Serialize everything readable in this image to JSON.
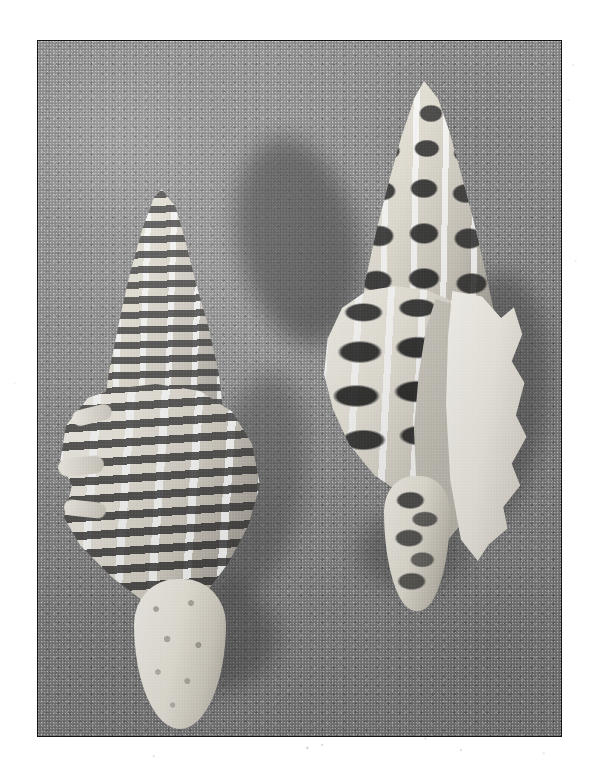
{
  "document": {
    "kind": "photograph",
    "medium": "black-and-white print",
    "page_background": "#ffffff",
    "caption": ""
  },
  "photo": {
    "title": "Two marine gastropod shells on sand",
    "frame": {
      "border_color": "#141414",
      "border_width_px": 1.6,
      "left_px": 37,
      "top_px": 40,
      "width_px": 525,
      "height_px": 697
    },
    "palette": {
      "sand_mid": "#8d8d8d",
      "sand_light": "#9a9a9a",
      "sand_dark": "#6f6f6f",
      "shadow": "#3a3a3a",
      "shell_highlight": "#fbf9f2",
      "shell_cream": "#ece8de",
      "shell_band_dark": "#262626",
      "aperture_gray": "#c4c0b6"
    },
    "background": {
      "name": "sand",
      "description": "coarse speckled beach sand, evenly grainy, lit from upper left"
    },
    "subjects": [
      {
        "id": "shell-left",
        "name": "left shell",
        "common_name": "banded murex shell",
        "orientation": "apex up-right, siphonal canal down-left",
        "surface": "strong horizontal dark spiral bands between raised white axial ribs",
        "apex_tone": "white",
        "canal_tone": "bright cream, knobby",
        "position": "lower-left of frame"
      },
      {
        "id": "shell-right",
        "name": "right shell",
        "common_name": "knobbed murex shell",
        "orientation": "apex up, aperture facing right",
        "surface": "rows of dark rectangular knobs separated by white ribs",
        "aperture": "smooth pale gray interior with scalloped white outer lip",
        "position": "upper-right of frame"
      }
    ],
    "shadows": [
      {
        "name": "shadow-behind-right-shell",
        "direction": "upper-left and right of right shell"
      },
      {
        "name": "shadow-right-of-left-shell",
        "direction": "right of left shell"
      },
      {
        "name": "shadow-below-left-shell",
        "direction": "lower-right of left shell canal"
      }
    ]
  }
}
